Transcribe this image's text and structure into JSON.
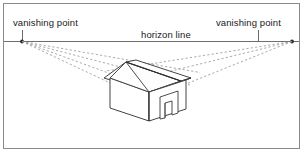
{
  "diagram": {
    "type": "two-point-perspective-illustration",
    "frame": {
      "border_color": "#808080",
      "background_color": "#ffffff",
      "x": 3,
      "y": 3,
      "width": 297,
      "height": 146
    },
    "labels": {
      "vanishing_point_left": "vanishing point",
      "vanishing_point_right": "vanishing point",
      "horizon_line": "horizon line"
    },
    "colors": {
      "line": "#3a3a3a",
      "horizon": "#6e6e6e",
      "dashed": "#9a9a9a",
      "text": "#1a1a1a",
      "shadow_fill": "#d9d9d9"
    },
    "horizon": {
      "y": 41.5,
      "x_start": 4,
      "x_end": 299
    },
    "vanishing_points": [
      {
        "name": "left",
        "x": 22,
        "y": 41.5
      },
      {
        "name": "right",
        "x": 292,
        "y": 41.5
      }
    ],
    "leader_lines": [
      {
        "name": "left-leader",
        "x": 22,
        "y_top": 30,
        "y_bottom": 41.5
      },
      {
        "name": "right-leader",
        "x": 258,
        "y_top": 30,
        "y_bottom": 41.5
      }
    ],
    "perspective_rays_left": [
      {
        "to_x": 198,
        "to_y": 73
      },
      {
        "to_x": 186,
        "to_y": 86
      },
      {
        "to_x": 176,
        "to_y": 99
      },
      {
        "to_x": 168,
        "to_y": 112
      }
    ],
    "perspective_rays_right": [
      {
        "to_x": 110,
        "to_y": 72
      },
      {
        "to_x": 116,
        "to_y": 87
      },
      {
        "to_x": 120,
        "to_y": 112
      }
    ],
    "house": {
      "ridge": [
        [
          124,
          63
        ],
        [
          176,
          82
        ]
      ],
      "eave_front_left": [
        [
          112,
          76
        ],
        [
          124,
          63
        ]
      ],
      "front_wall_top": [
        [
          112,
          76
        ],
        [
          150,
          89
        ]
      ],
      "front_wall_left": [
        [
          112,
          76
        ],
        [
          112,
          107
        ]
      ],
      "front_wall_bottom": [
        [
          112,
          107
        ],
        [
          150,
          119
        ]
      ],
      "front_wall_right": [
        [
          150,
          89
        ],
        [
          150,
          119
        ]
      ],
      "right_wall_top": [
        [
          150,
          89
        ],
        [
          185,
          80
        ]
      ],
      "right_wall_bottom": [
        [
          150,
          119
        ],
        [
          185,
          107
        ]
      ],
      "right_wall_edge": [
        [
          185,
          80
        ],
        [
          185,
          107
        ]
      ],
      "roof_left_slope": [
        [
          105,
          77
        ],
        [
          124,
          63
        ]
      ],
      "roof_front_edge": [
        [
          105,
          77
        ],
        [
          147,
          91
        ]
      ],
      "roof_ridge_right": [
        [
          124,
          63
        ],
        [
          180,
          83
        ]
      ],
      "roof_right_eave": [
        [
          147,
          91
        ],
        [
          190,
          79
        ]
      ],
      "door": {
        "top_left": [
          162,
          95
        ],
        "top_right": [
          177,
          92
        ],
        "bottom_left": [
          162,
          116
        ],
        "bottom_right": [
          177,
          113
        ],
        "inner_left": [
          167,
          99
        ],
        "inner_bottom": [
          167,
          115
        ]
      }
    }
  }
}
